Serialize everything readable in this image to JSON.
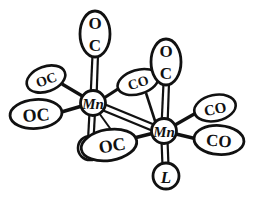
{
  "figure": {
    "background_color": "#ffffff",
    "ink_color": "#111111",
    "style": "hand-drawn line structure"
  },
  "metal_centers": [
    {
      "id": "mn-left",
      "label": "Mn",
      "cx": 93,
      "cy": 103,
      "r": 12.5,
      "font_size": 15
    },
    {
      "id": "mn-right",
      "label": "Mn",
      "cx": 164,
      "cy": 131,
      "r": 12.5,
      "font_size": 15
    }
  ],
  "ligands": [
    {
      "id": "lig-top-left",
      "label": "OC",
      "orientation": "vertical",
      "cx": 95,
      "cy": 34,
      "rx": 15,
      "ry": 23,
      "rotate": 0,
      "font_size": 16,
      "stacked": true,
      "attached_to": "mn-left",
      "bond": "double"
    },
    {
      "id": "lig-upper-left",
      "label": "OC",
      "orientation": "tilted",
      "cx": 46,
      "cy": 79,
      "rx": 20,
      "ry": 12,
      "rotate": -20,
      "font_size": 13,
      "stacked": false,
      "attached_to": "mn-left",
      "bond": "single"
    },
    {
      "id": "lig-lower-left",
      "label": "OC",
      "orientation": "horizontal",
      "cx": 36,
      "cy": 114,
      "rx": 25,
      "ry": 14,
      "rotate": -4,
      "font_size": 17,
      "stacked": false,
      "attached_to": "mn-left",
      "bond": "single"
    },
    {
      "id": "lig-bridge-co",
      "label": "CO",
      "orientation": "tilted",
      "cx": 138,
      "cy": 82,
      "rx": 21,
      "ry": 12,
      "rotate": -17,
      "font_size": 13,
      "stacked": false,
      "attached_to": "mn-right",
      "bond": "single"
    },
    {
      "id": "lig-top-right",
      "label": "OC",
      "orientation": "vertical",
      "cx": 166,
      "cy": 62,
      "rx": 15,
      "ry": 23,
      "rotate": 0,
      "font_size": 16,
      "stacked": true,
      "attached_to": "mn-right",
      "bond": "double"
    },
    {
      "id": "lig-upper-right",
      "label": "CO",
      "orientation": "tilted",
      "cx": 215,
      "cy": 108,
      "rx": 21,
      "ry": 13,
      "rotate": -12,
      "font_size": 14,
      "stacked": false,
      "attached_to": "mn-right",
      "bond": "single"
    },
    {
      "id": "lig-lower-right",
      "label": "CO",
      "orientation": "horizontal",
      "cx": 219,
      "cy": 140,
      "rx": 24,
      "ry": 14,
      "rotate": 4,
      "font_size": 16,
      "stacked": false,
      "attached_to": "mn-right",
      "bond": "single"
    },
    {
      "id": "lig-bottom-center",
      "label": "OC",
      "orientation": "tilted",
      "cx": 109,
      "cy": 145,
      "rx": 27,
      "ry": 15,
      "rotate": -9,
      "font_size": 17,
      "stacked": false,
      "attached_to": "mn-right",
      "bond": "single"
    }
  ],
  "l_ligands": [
    {
      "id": "l-left",
      "label": "L",
      "cx": 90,
      "cy": 148,
      "r": 12,
      "font_size": 15,
      "attached_to": "mn-left",
      "bond": "double",
      "occluded_by": "lig-bottom-center"
    },
    {
      "id": "l-bottom",
      "label": "L",
      "cx": 166,
      "cy": 176,
      "r": 13,
      "font_size": 16,
      "attached_to": "mn-right",
      "bond": "double"
    }
  ],
  "bonds": [
    {
      "id": "bond-mn-mn",
      "from": "mn-left",
      "to": "mn-right",
      "type": "double",
      "description": "metal-metal bond"
    }
  ],
  "legend": {
    "metal_symbol": "Mn",
    "carbonyl_symbols": [
      "CO",
      "OC"
    ],
    "generic_ligand_symbol": "L"
  }
}
